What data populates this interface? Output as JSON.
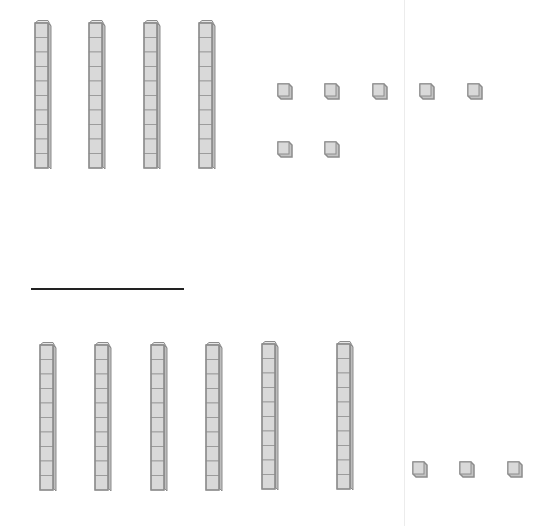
{
  "diagram": {
    "type": "base-ten-blocks",
    "colors": {
      "block_fill": "#d9d9d9",
      "block_edge": "#8c8c8c",
      "line": "#222222"
    },
    "top_group": {
      "tens_rods": 4,
      "ones_cubes": 7,
      "rods": [
        {
          "x": 34,
          "y": 20
        },
        {
          "x": 88,
          "y": 20
        },
        {
          "x": 143,
          "y": 20
        },
        {
          "x": 198,
          "y": 20
        }
      ],
      "cubes": [
        {
          "x": 276,
          "y": 83
        },
        {
          "x": 323,
          "y": 83
        },
        {
          "x": 371,
          "y": 83
        },
        {
          "x": 418,
          "y": 83
        },
        {
          "x": 466,
          "y": 83
        },
        {
          "x": 276,
          "y": 141
        },
        {
          "x": 323,
          "y": 141
        }
      ]
    },
    "answer_line": {
      "x": 31,
      "y": 288,
      "width": 153
    },
    "bottom_group": {
      "tens_rods": 6,
      "ones_cubes": 3,
      "rods": [
        {
          "x": 39,
          "y": 342
        },
        {
          "x": 94,
          "y": 342
        },
        {
          "x": 150,
          "y": 342
        },
        {
          "x": 205,
          "y": 342
        },
        {
          "x": 261,
          "y": 341
        },
        {
          "x": 336,
          "y": 341
        }
      ],
      "cubes": [
        {
          "x": 411,
          "y": 461
        },
        {
          "x": 458,
          "y": 461
        },
        {
          "x": 506,
          "y": 461
        }
      ]
    }
  }
}
